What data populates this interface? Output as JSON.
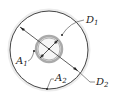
{
  "diagram": {
    "type": "concentric-circles-cross-section",
    "labels": {
      "d1": {
        "base": "D",
        "sub": "1"
      },
      "d2": {
        "base": "D",
        "sub": "2"
      },
      "a1": {
        "base": "A",
        "sub": "1"
      },
      "a2": {
        "base": "A",
        "sub": "2"
      }
    },
    "colors": {
      "line": "#333333",
      "inner_ring": "#b8b8b8",
      "inner_fill": "#e6e6e6",
      "outer_halo": "#e8e8e8"
    }
  }
}
